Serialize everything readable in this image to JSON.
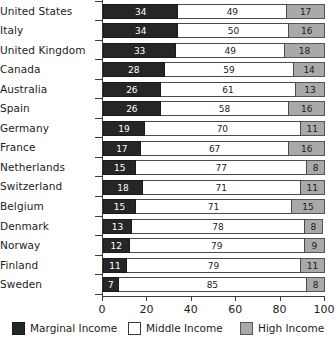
{
  "chart_data": {
    "type": "bar",
    "subtype": "stacked-horizontal-100",
    "title": "",
    "xlabel": "",
    "ylabel": "",
    "xlim": [
      0,
      100
    ],
    "xticks": [
      0,
      20,
      40,
      60,
      80,
      100
    ],
    "grid": false,
    "legend_position": "bottom",
    "categories": [
      "United States",
      "Italy",
      "United Kingdom",
      "Canada",
      "Australia",
      "Spain",
      "Germany",
      "France",
      "Netherlands",
      "Switzerland",
      "Belgium",
      "Denmark",
      "Norway",
      "Finland",
      "Sweden"
    ],
    "series": [
      {
        "name": "Marginal Income",
        "color": "#262626",
        "values": [
          34,
          34,
          33,
          28,
          26,
          26,
          19,
          17,
          15,
          18,
          15,
          13,
          12,
          11,
          7
        ]
      },
      {
        "name": "Middle Income",
        "color": "#ffffff",
        "values": [
          49,
          50,
          49,
          59,
          61,
          58,
          70,
          67,
          77,
          71,
          71,
          78,
          79,
          79,
          85
        ]
      },
      {
        "name": "High Income",
        "color": "#a9a9a9",
        "values": [
          17,
          16,
          18,
          14,
          13,
          16,
          11,
          16,
          8,
          11,
          15,
          8,
          9,
          11,
          8
        ]
      }
    ]
  },
  "legend": {
    "items": [
      {
        "label": "Marginal Income",
        "swatch": "legend-swatch-dark"
      },
      {
        "label": "Middle Income",
        "swatch": "legend-swatch-white"
      },
      {
        "label": "High Income",
        "swatch": "legend-swatch-gray"
      }
    ]
  }
}
